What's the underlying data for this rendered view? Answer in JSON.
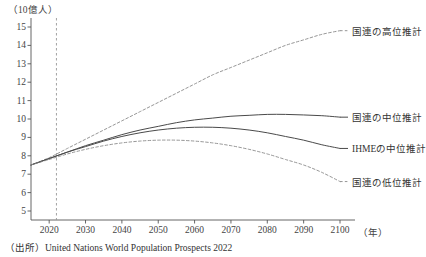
{
  "chart_data": {
    "type": "line",
    "title": "",
    "ylabel": "（10億人）",
    "xlabel": "（年）",
    "ylim": [
      4.5,
      15.4
    ],
    "xlim": [
      2015,
      2103
    ],
    "grid": false,
    "legend_position": "right-inline",
    "yticks": [
      15,
      14,
      13,
      12,
      11,
      10,
      9,
      8,
      7,
      6,
      5
    ],
    "ytick_labels": [
      "15",
      "14",
      "13",
      "12",
      "11",
      "10",
      "9",
      "8",
      "7",
      "6",
      "5"
    ],
    "xticks": [
      2020,
      2030,
      2040,
      2050,
      2060,
      2070,
      2080,
      2090,
      2100
    ],
    "xtick_labels": [
      "2020",
      "2030",
      "2040",
      "2050",
      "2060",
      "2070",
      "2080",
      "2090",
      "2100"
    ],
    "marker_year": 2022,
    "x": [
      2015,
      2020,
      2025,
      2030,
      2035,
      2040,
      2045,
      2050,
      2055,
      2060,
      2065,
      2070,
      2075,
      2080,
      2085,
      2090,
      2095,
      2100
    ],
    "series": [
      {
        "name": "国連の高位推計",
        "style": "dashed",
        "values": [
          7.5,
          7.9,
          8.4,
          8.9,
          9.4,
          9.9,
          10.4,
          10.9,
          11.4,
          11.9,
          12.4,
          12.8,
          13.2,
          13.6,
          14.0,
          14.3,
          14.6,
          14.8
        ]
      },
      {
        "name": "国連の中位推計",
        "style": "solid",
        "values": [
          7.5,
          7.85,
          8.2,
          8.55,
          8.85,
          9.15,
          9.4,
          9.6,
          9.8,
          9.95,
          10.05,
          10.15,
          10.2,
          10.25,
          10.25,
          10.22,
          10.18,
          10.1
        ]
      },
      {
        "name": "IHMEの中位推計",
        "style": "solid",
        "values": [
          7.5,
          7.85,
          8.2,
          8.5,
          8.8,
          9.05,
          9.25,
          9.4,
          9.5,
          9.55,
          9.55,
          9.5,
          9.4,
          9.25,
          9.05,
          8.85,
          8.6,
          8.4
        ]
      },
      {
        "name": "国連の低位推計",
        "style": "dashed",
        "values": [
          7.5,
          7.8,
          8.1,
          8.35,
          8.55,
          8.7,
          8.8,
          8.85,
          8.85,
          8.8,
          8.7,
          8.55,
          8.35,
          8.1,
          7.8,
          7.5,
          7.1,
          6.6
        ]
      }
    ],
    "colors": {
      "solid_line": "#4a4a4a",
      "dashed_line": "#8a8a8a",
      "axis": "#555555",
      "marker_line": "#999999",
      "text": "#333333"
    }
  },
  "source": {
    "prefix": "（出所）",
    "text": "United Nations World Population Prospects 2022"
  }
}
